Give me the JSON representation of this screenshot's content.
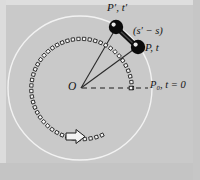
{
  "figure": {
    "name": "circular-motion-diagram",
    "background_color": "#c9c9c9",
    "frame_color": "#d8d8d8",
    "circle_color": "#f2f2f2",
    "marker_color": "#f5f5f5",
    "marker_outline": "#1a1a1a",
    "ball_color": "#0c0c0c",
    "line_color": "#2a2a2a",
    "width": 200,
    "height": 180
  },
  "labels": {
    "p_prime": "P′, t′",
    "delta_s": "(s′ − s)",
    "p": "P, t",
    "origin": "O",
    "p_zero": "P₀, t = 0"
  },
  "geometry": {
    "center": {
      "x": 80,
      "y": 88
    },
    "outer_circle_radius": 72,
    "marker_path_radius": 52,
    "ball_p_prime": {
      "x": 116,
      "y": 27
    },
    "ball_p": {
      "x": 138,
      "y": 47
    },
    "p_zero_marker": {
      "x": 131,
      "y": 88
    },
    "direction_arrow": {
      "x": 76,
      "y": 137,
      "heading": "right"
    }
  },
  "chart_data": {
    "type": "scatter",
    "title": "",
    "marker_count": 46,
    "marker_shape": "square",
    "arc_start_angle_deg": 0,
    "arc_end_angle_deg": 295,
    "annotations": [
      "P′, t′",
      "(s′ − s)",
      "P, t",
      "O",
      "P₀, t = 0"
    ]
  }
}
